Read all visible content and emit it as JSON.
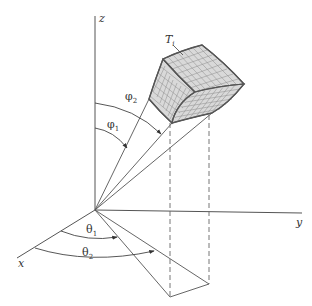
{
  "figure": {
    "axes": {
      "z_label": "z",
      "y_label": "y",
      "x_label": "x"
    },
    "region_label": {
      "text": "T",
      "subscript": "i"
    },
    "angles": {
      "phi1": {
        "symbol": "φ",
        "subscript": "1"
      },
      "phi2": {
        "symbol": "φ",
        "subscript": "2"
      },
      "theta1": {
        "symbol": "θ",
        "subscript": "1"
      },
      "theta2": {
        "symbol": "θ",
        "subscript": "2"
      }
    },
    "colors": {
      "line": "#555555",
      "face_fill": "#d9d9d9",
      "grid": "#8a8a8a",
      "background": "#ffffff"
    }
  }
}
